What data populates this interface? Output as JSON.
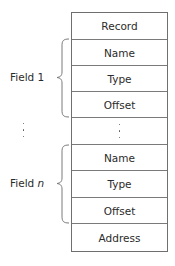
{
  "diagram": {
    "type": "record-layout",
    "cells": [
      {
        "label": "Record"
      },
      {
        "label": "Name"
      },
      {
        "label": "Type"
      },
      {
        "label": "Offset"
      },
      {
        "label": "⋮",
        "ellipsis": true
      },
      {
        "label": "Name"
      },
      {
        "label": "Type"
      },
      {
        "label": "Offset"
      },
      {
        "label": "Address"
      }
    ],
    "groups": [
      {
        "label_prefix": "Field ",
        "label_index": "1",
        "index_italic": false,
        "spans": [
          "Name",
          "Type",
          "Offset"
        ]
      },
      {
        "label_prefix": "Field ",
        "label_index": "n",
        "index_italic": true,
        "spans": [
          "Name",
          "Type",
          "Offset"
        ]
      }
    ],
    "between_groups": "⋮",
    "colors": {
      "border": "#6f6f6f",
      "text": "#2b2b2b",
      "brace": "#7a7a7a"
    }
  }
}
